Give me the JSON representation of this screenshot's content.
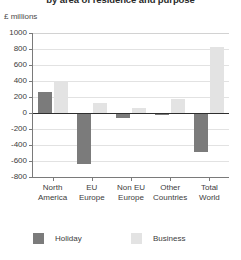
{
  "chart_data": {
    "type": "bar",
    "title": "by area of residence and purpose",
    "subtitle": "",
    "units_label": "£ millions",
    "xlabel": "",
    "ylabel": "",
    "ylim": [
      -800,
      1000
    ],
    "ytick_step": 200,
    "ytick_labels": [
      "1000",
      "800",
      "600",
      "400",
      "200",
      "0",
      "-200",
      "-400",
      "-600",
      "-800"
    ],
    "ytick_values": [
      1000,
      800,
      600,
      400,
      200,
      0,
      -200,
      -400,
      -600,
      -800
    ],
    "grid": true,
    "legend_position": "bottom",
    "categories": [
      "North America",
      "EU Europe",
      "Non EU Europe",
      "Other Countries",
      "Total World"
    ],
    "category_lines": [
      [
        "North",
        "America"
      ],
      [
        "EU",
        "Europe"
      ],
      [
        "Non EU",
        "Europe"
      ],
      [
        "Other",
        "Countries"
      ],
      [
        "Total",
        "World"
      ]
    ],
    "series": [
      {
        "name": "Holiday",
        "color": "#7b7b7b",
        "values": [
          260,
          -640,
          -60,
          -30,
          -490
        ]
      },
      {
        "name": "Business",
        "color": "#e3e3e3",
        "values": [
          400,
          130,
          60,
          180,
          830
        ]
      }
    ]
  },
  "legend": {
    "items": [
      {
        "label": "Holiday",
        "swatch": "holiday"
      },
      {
        "label": "Business",
        "swatch": "business"
      }
    ]
  }
}
